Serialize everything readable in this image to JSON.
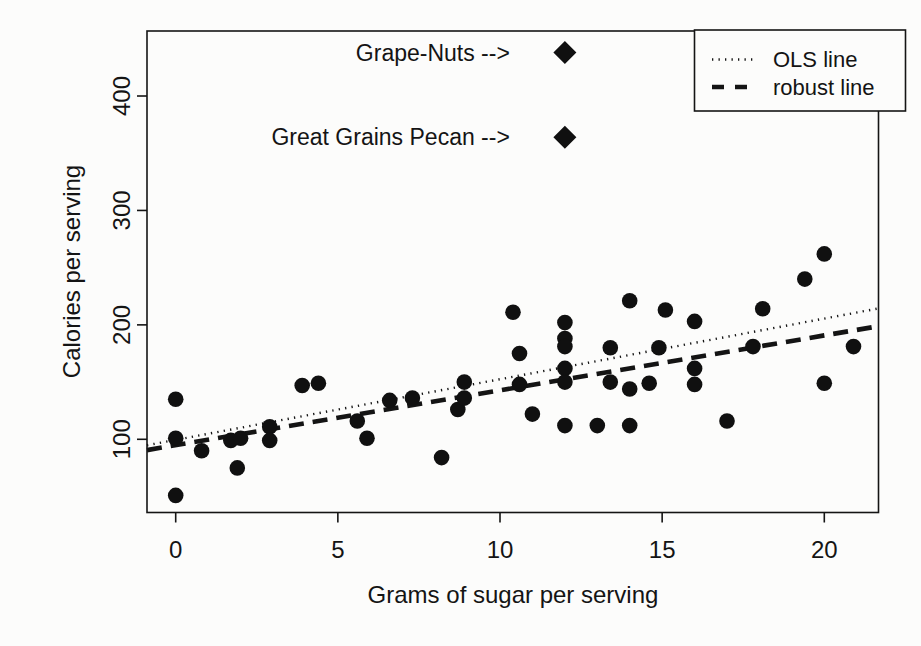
{
  "page": {
    "background": "#fcfcfb",
    "ink": "#141414"
  },
  "chart_data": {
    "type": "scatter",
    "title": "",
    "xlabel": "Grams of sugar per serving",
    "ylabel": "Calories per serving",
    "x_ticks": [
      0,
      5,
      10,
      15,
      20
    ],
    "y_ticks": [
      100,
      200,
      300,
      400
    ],
    "xlim": [
      -0.9,
      21.7
    ],
    "ylim": [
      36,
      457
    ],
    "grid": false,
    "legend_position": "top-right",
    "points": [
      [
        0,
        135
      ],
      [
        0,
        101
      ],
      [
        0,
        51
      ],
      [
        0.8,
        90
      ],
      [
        1.7,
        99
      ],
      [
        2,
        101
      ],
      [
        1.9,
        75
      ],
      [
        2.9,
        111
      ],
      [
        2.9,
        99
      ],
      [
        3.9,
        147
      ],
      [
        4.4,
        149
      ],
      [
        5.6,
        116
      ],
      [
        5.9,
        101
      ],
      [
        6.6,
        134
      ],
      [
        7.3,
        136
      ],
      [
        8.2,
        84
      ],
      [
        8.7,
        126
      ],
      [
        8.9,
        150
      ],
      [
        8.9,
        136
      ],
      [
        10.4,
        211
      ],
      [
        10.6,
        175
      ],
      [
        10.6,
        148
      ],
      [
        11,
        122
      ],
      [
        12,
        202
      ],
      [
        12,
        188
      ],
      [
        12,
        181
      ],
      [
        12,
        162
      ],
      [
        12,
        150
      ],
      [
        12,
        112
      ],
      [
        13,
        112
      ],
      [
        13.4,
        180
      ],
      [
        13.4,
        150
      ],
      [
        14,
        221
      ],
      [
        14,
        144
      ],
      [
        14,
        112
      ],
      [
        14.6,
        149
      ],
      [
        14.9,
        180
      ],
      [
        15.1,
        213
      ],
      [
        16,
        203
      ],
      [
        16,
        162
      ],
      [
        16,
        148
      ],
      [
        17,
        116
      ],
      [
        17.8,
        181
      ],
      [
        18.1,
        214
      ],
      [
        19.4,
        240
      ],
      [
        20,
        262
      ],
      [
        20,
        149
      ],
      [
        20.9,
        181
      ]
    ],
    "outliers": [
      {
        "label": "Grape-Nuts -->",
        "sugar": 12,
        "calories": 438
      },
      {
        "label": "Great Grains Pecan -->",
        "sugar": 12,
        "calories": 364
      }
    ],
    "lines": [
      {
        "name": "OLS line",
        "style": "dotted",
        "intercept": 99.5,
        "slope": 5.3
      },
      {
        "name": "robust line",
        "style": "dashed",
        "intercept": 94.8,
        "slope": 4.8
      }
    ]
  }
}
